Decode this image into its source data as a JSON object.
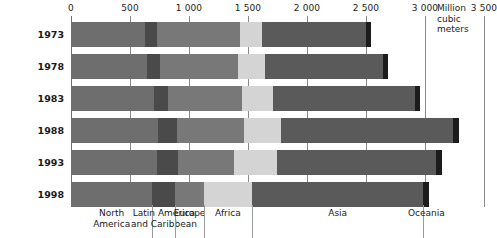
{
  "chart_data": {
    "type": "bar",
    "orientation": "horizontal",
    "stacked": true,
    "title": "",
    "xlabel": "Million cubic meters",
    "ylabel": "",
    "xlim": [
      0,
      3500
    ],
    "xticks": [
      0,
      500,
      1000,
      1500,
      2000,
      2500,
      3000,
      3500
    ],
    "xtick_labels": [
      "0",
      "500",
      "1 000",
      "1 500",
      "2 000",
      "2 500",
      "3 000",
      "3 500"
    ],
    "grid": true,
    "legend_position": "bottom",
    "categories": [
      "1973",
      "1978",
      "1983",
      "1988",
      "1993",
      "1998"
    ],
    "series": [
      {
        "name": "North America",
        "color": "#6e6e6e",
        "values": [
          630,
          640,
          700,
          740,
          730,
          690
        ]
      },
      {
        "name": "Latin America and Caribbean",
        "color": "#4a4a4a",
        "values": [
          100,
          115,
          125,
          160,
          175,
          195
        ]
      },
      {
        "name": "Europe",
        "color": "#787878",
        "values": [
          700,
          660,
          620,
          570,
          480,
          240
        ]
      },
      {
        "name": "Africa",
        "color": "#d4d4d4",
        "values": [
          190,
          230,
          270,
          310,
          360,
          410
        ]
      },
      {
        "name": "Asia",
        "color": "#5a5a5a",
        "values": [
          880,
          1000,
          1200,
          1460,
          1350,
          1450
        ]
      },
      {
        "name": "Oceania",
        "color": "#1c1c1c",
        "values": [
          40,
          42,
          45,
          48,
          50,
          52
        ]
      }
    ],
    "totals": [
      2540,
      2687,
      2960,
      3288,
      3145,
      3037
    ],
    "unit_note": "Million\ncubic\nmeters"
  },
  "axis": {
    "unit_line1": "Million",
    "unit_line2": "cubic",
    "unit_line3": "meters"
  },
  "legend": {
    "items": [
      {
        "label": "North\nAmerica"
      },
      {
        "label": "Latin America\nand Caribbean"
      },
      {
        "label": "Europe"
      },
      {
        "label": "Africa"
      },
      {
        "label": "Asia"
      },
      {
        "label": "Oceania"
      }
    ]
  }
}
